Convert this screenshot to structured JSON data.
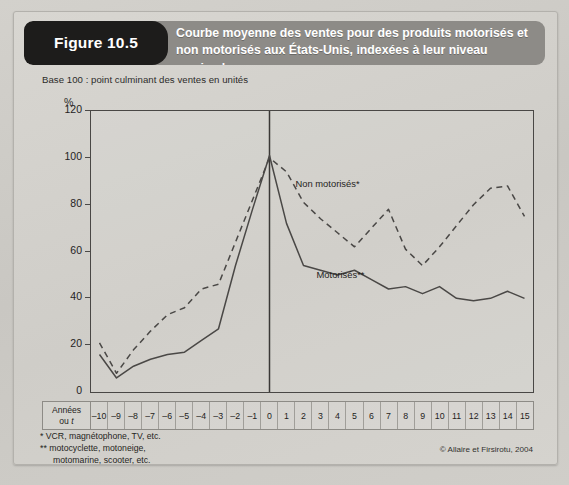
{
  "figure": {
    "badge_label": "Figure 10.5",
    "title_line1": "Courbe moyenne des ventes pour des produits motorisés et",
    "title_line2": "non motorisés aux États-Unis, indexées à leur niveau maximal",
    "caption": "Base 100 : point culminant des ventes en unités",
    "footnote_1": "* VCR, magnétophone, TV, etc.",
    "footnote_2_line1": "** motocyclette, motoneige,",
    "footnote_2_line2": "motomarine, scooter, etc.",
    "credit": "© Allaire et Firsirotu, 2004",
    "x_axis_row_label_line1": "Années",
    "x_axis_row_label_line2_prefix": "ou ",
    "x_axis_row_label_line2_italic": "t"
  },
  "colors": {
    "header_band": "#8d8b87",
    "badge": "#1d1c1b",
    "paper": "#d2d0cb",
    "line": "#4a4846",
    "axis": "#494745"
  },
  "chart_data": {
    "type": "line",
    "title": "Courbe moyenne des ventes pour des produits motorisés et non motorisés aux États-Unis, indexées à leur niveau maximal",
    "subtitle": "Base 100 : point culminant des ventes en unités",
    "xlabel": "Années ou t",
    "ylabel": "%",
    "ylim": [
      0,
      120
    ],
    "xlim": [
      -10,
      15
    ],
    "yticks": [
      120,
      100,
      80,
      60,
      40,
      20,
      0
    ],
    "grid": false,
    "legend_position": "inline-annotations",
    "annotations": [
      {
        "text": "Non motorisés*",
        "x": 3,
        "y": 84
      },
      {
        "text": "Motorisés**",
        "x": 4,
        "y": 46
      }
    ],
    "vertical_reference_line_x": 0,
    "x": [
      -10,
      -9,
      -8,
      -7,
      -6,
      -5,
      -4,
      -3,
      -2,
      -1,
      0,
      1,
      2,
      3,
      4,
      5,
      6,
      7,
      8,
      9,
      10,
      11,
      12,
      13,
      14,
      15
    ],
    "xticklabels": [
      "–10",
      "–9",
      "–8",
      "–7",
      "–6",
      "–5",
      "–4",
      "–3",
      "–2",
      "–1",
      "0",
      "1",
      "2",
      "3",
      "4",
      "5",
      "6",
      "7",
      "8",
      "9",
      "10",
      "11",
      "12",
      "13",
      "14",
      "15"
    ],
    "series": [
      {
        "name": "Non motorisés*",
        "style": "dashed",
        "values": [
          21,
          8,
          18,
          26,
          33,
          36,
          44,
          46,
          64,
          82,
          100,
          94,
          81,
          74,
          68,
          62,
          70,
          78,
          61,
          54,
          62,
          71,
          80,
          87,
          88,
          75
        ]
      },
      {
        "name": "Motorisés**",
        "style": "solid",
        "values": [
          16,
          6,
          11,
          14,
          16,
          17,
          22,
          27,
          54,
          78,
          101,
          72,
          54,
          52,
          50,
          52,
          48,
          44,
          45,
          42,
          45,
          40,
          39,
          40,
          43,
          40
        ]
      }
    ]
  }
}
